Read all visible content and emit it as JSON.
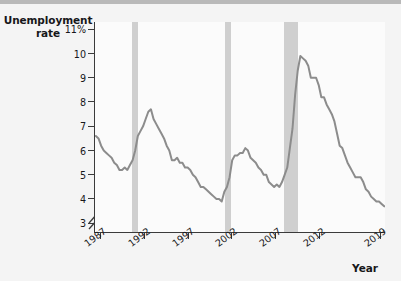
{
  "figure": {
    "background_color": "#f4f4f4",
    "plot_background_color": "#fbfbfb",
    "top_band_color": "#b9b9b9",
    "axis_color": "#3a3a3a",
    "line_color": "#8c8c8c",
    "recession_band_color": "#c4c4c4"
  },
  "axes": {
    "y_caption_line1": "Unemployment",
    "y_caption_line2": "rate",
    "x_caption": "Year"
  },
  "chart_data": {
    "type": "line",
    "title": "",
    "xlabel": "Year",
    "ylabel": "Unemployment rate",
    "ylim": [
      2.6,
      11.3
    ],
    "xlim": [
      1986.3,
      2019.6
    ],
    "grid": false,
    "legend": null,
    "y_tick_labels": [
      "11%",
      "10",
      "9",
      "8",
      "7",
      "6",
      "5",
      "4",
      "3"
    ],
    "y_tick_values": [
      11,
      10,
      9,
      8,
      7,
      6,
      5,
      4,
      3
    ],
    "x_tick_labels": [
      "1987",
      "1992",
      "1997",
      "2002",
      "2007",
      "2012",
      "2019"
    ],
    "x_tick_values": [
      1987,
      1992,
      1997,
      2002,
      2007,
      2012,
      2019
    ],
    "axis_break": "y-axis broken below 3",
    "annotations": [
      {
        "name": "recession-1990-1991",
        "x_start": 1990.5,
        "x_end": 1991.2
      },
      {
        "name": "recession-2001",
        "x_start": 2001.2,
        "x_end": 2001.9
      },
      {
        "name": "recession-2007-2009",
        "x_start": 2007.9,
        "x_end": 2009.5
      }
    ],
    "series": [
      {
        "name": "Unemployment rate",
        "x": [
          1986.4,
          1986.7,
          1987.0,
          1987.3,
          1987.6,
          1987.9,
          1988.2,
          1988.5,
          1988.8,
          1989.1,
          1989.4,
          1989.7,
          1990.0,
          1990.3,
          1990.6,
          1990.9,
          1991.2,
          1991.5,
          1991.8,
          1992.1,
          1992.4,
          1992.7,
          1993.0,
          1993.3,
          1993.6,
          1993.9,
          1994.2,
          1994.5,
          1994.8,
          1995.1,
          1995.4,
          1995.7,
          1996.0,
          1996.3,
          1996.6,
          1996.9,
          1997.2,
          1997.5,
          1997.8,
          1998.1,
          1998.4,
          1998.7,
          1999.0,
          1999.3,
          1999.6,
          1999.9,
          2000.2,
          2000.5,
          2000.8,
          2001.1,
          2001.4,
          2001.7,
          2002.0,
          2002.3,
          2002.6,
          2002.9,
          2003.2,
          2003.5,
          2003.8,
          2004.1,
          2004.4,
          2004.7,
          2005.0,
          2005.3,
          2005.6,
          2005.9,
          2006.2,
          2006.5,
          2006.8,
          2007.1,
          2007.4,
          2007.7,
          2008.0,
          2008.3,
          2008.6,
          2008.9,
          2009.2,
          2009.5,
          2009.8,
          2010.1,
          2010.4,
          2010.7,
          2011.0,
          2011.3,
          2011.6,
          2011.9,
          2012.2,
          2012.5,
          2012.8,
          2013.1,
          2013.4,
          2013.7,
          2014.0,
          2014.3,
          2014.6,
          2014.9,
          2015.2,
          2015.5,
          2015.8,
          2016.1,
          2016.4,
          2016.7,
          2017.0,
          2017.3,
          2017.6,
          2017.9,
          2018.2,
          2018.5,
          2018.8,
          2019.1,
          2019.4
        ],
        "y": [
          6.6,
          6.5,
          6.2,
          6.0,
          5.9,
          5.8,
          5.7,
          5.5,
          5.4,
          5.2,
          5.2,
          5.3,
          5.2,
          5.4,
          5.6,
          6.0,
          6.6,
          6.8,
          7.0,
          7.3,
          7.6,
          7.7,
          7.3,
          7.1,
          6.9,
          6.7,
          6.5,
          6.2,
          6.0,
          5.6,
          5.6,
          5.7,
          5.5,
          5.5,
          5.3,
          5.3,
          5.2,
          5.0,
          4.9,
          4.7,
          4.5,
          4.5,
          4.4,
          4.3,
          4.2,
          4.1,
          4.0,
          4.0,
          3.9,
          4.3,
          4.5,
          4.9,
          5.6,
          5.8,
          5.8,
          5.9,
          5.9,
          6.1,
          6.0,
          5.7,
          5.6,
          5.5,
          5.3,
          5.2,
          5.0,
          5.0,
          4.7,
          4.6,
          4.5,
          4.6,
          4.5,
          4.7,
          5.0,
          5.3,
          6.1,
          6.9,
          8.3,
          9.3,
          9.9,
          9.8,
          9.7,
          9.5,
          9.0,
          9.0,
          9.0,
          8.7,
          8.2,
          8.2,
          7.9,
          7.7,
          7.5,
          7.2,
          6.7,
          6.2,
          6.1,
          5.8,
          5.5,
          5.3,
          5.1,
          4.9,
          4.9,
          4.9,
          4.7,
          4.4,
          4.3,
          4.1,
          4.0,
          3.9,
          3.9,
          3.8,
          3.7
        ]
      }
    ]
  }
}
